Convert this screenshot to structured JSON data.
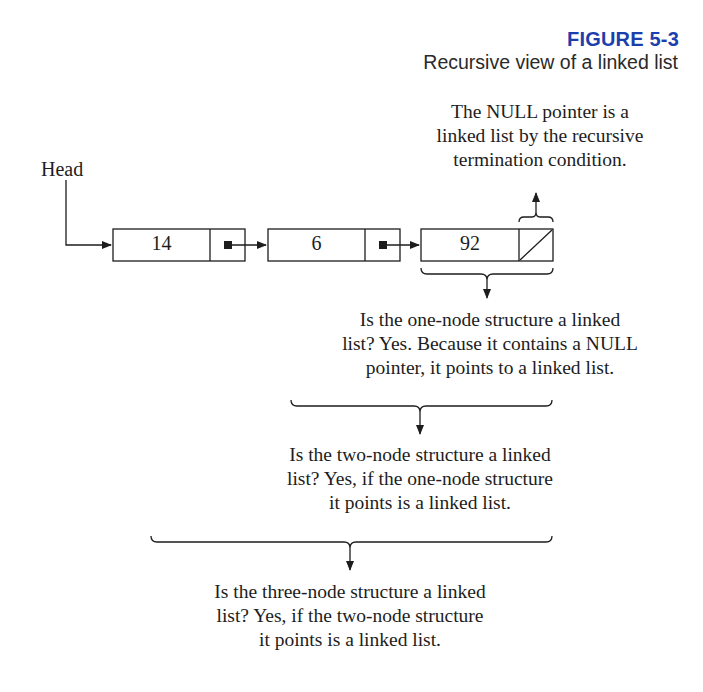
{
  "figure": {
    "label": "FIGURE 5-3",
    "caption": "Recursive view of a linked list",
    "label_color": "#1c3fae"
  },
  "diagram": {
    "head_label": "Head",
    "nodes": [
      {
        "value": "14",
        "pointer": "next"
      },
      {
        "value": "6",
        "pointer": "next"
      },
      {
        "value": "92",
        "pointer": "NULL"
      }
    ],
    "annotations": {
      "null_note": [
        "The NULL pointer is a",
        "linked list by the recursive",
        "termination condition."
      ],
      "one_node": [
        "Is the one-node structure a linked",
        "list? Yes. Because it contains a NULL",
        "pointer, it points to a linked list."
      ],
      "two_node": [
        "Is the two-node structure a linked",
        "list? Yes, if the one-node structure",
        "it points is a linked list."
      ],
      "three_node": [
        "Is the three-node structure a linked",
        "list? Yes, if the two-node structure",
        "it points is a linked list."
      ]
    }
  }
}
